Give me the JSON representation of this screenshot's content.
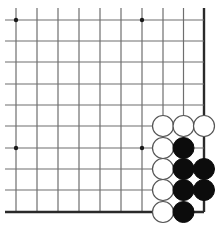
{
  "board": {
    "description": "Go problem diagram showing the bottom-right corner region of a board",
    "columns": 10,
    "rows": 10,
    "col_x": [
      16,
      37,
      58,
      79,
      100,
      121,
      142,
      163,
      183.5,
      204
    ],
    "row_y": [
      20,
      41,
      62,
      84,
      105,
      126,
      148,
      169,
      190,
      212
    ],
    "open_left": true,
    "open_top": true,
    "edge_right": true,
    "edge_bottom": true,
    "line_start_x": 5,
    "line_start_y": 8,
    "star_points": [
      {
        "col": 0,
        "row": 0
      },
      {
        "col": 6,
        "row": 0
      },
      {
        "col": 0,
        "row": 6
      },
      {
        "col": 6,
        "row": 6
      }
    ],
    "stone_radius": 10.5,
    "colors": {
      "background": "#ffffff",
      "grid": "#6e6e6e",
      "edge": "#2a2a2a",
      "black_stone": "#0c0c0c",
      "white_stone": "#ffffff",
      "white_stone_outline": "#555555"
    },
    "stones": [
      {
        "color": "white",
        "col": 7,
        "row": 5
      },
      {
        "color": "white",
        "col": 8,
        "row": 5
      },
      {
        "color": "white",
        "col": 9,
        "row": 5
      },
      {
        "color": "white",
        "col": 7,
        "row": 6
      },
      {
        "color": "black",
        "col": 8,
        "row": 6
      },
      {
        "color": "white",
        "col": 7,
        "row": 7
      },
      {
        "color": "black",
        "col": 8,
        "row": 7
      },
      {
        "color": "black",
        "col": 9,
        "row": 7
      },
      {
        "color": "white",
        "col": 7,
        "row": 8
      },
      {
        "color": "black",
        "col": 8,
        "row": 8
      },
      {
        "color": "black",
        "col": 9,
        "row": 8
      },
      {
        "color": "white",
        "col": 7,
        "row": 9
      },
      {
        "color": "black",
        "col": 8,
        "row": 9
      }
    ]
  }
}
